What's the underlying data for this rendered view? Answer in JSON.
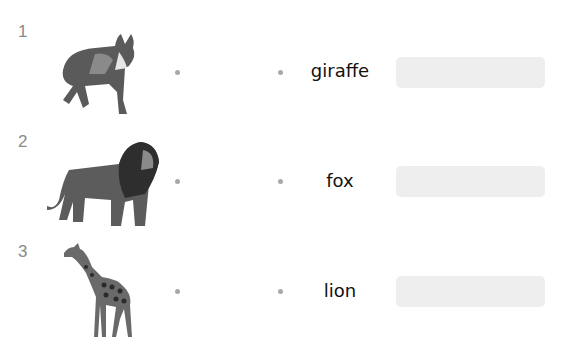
{
  "worksheet": {
    "rows": [
      {
        "number": "1",
        "animal_image": "fox",
        "word": "giraffe",
        "answer_value": ""
      },
      {
        "number": "2",
        "animal_image": "lion",
        "word": "fox",
        "answer_value": ""
      },
      {
        "number": "3",
        "animal_image": "giraffe",
        "word": "lion",
        "answer_value": ""
      }
    ]
  },
  "colors": {
    "number": "#8a8a8a",
    "dot": "#a8a8a8",
    "answer_box": "#eeeeee",
    "word": "#111111"
  }
}
